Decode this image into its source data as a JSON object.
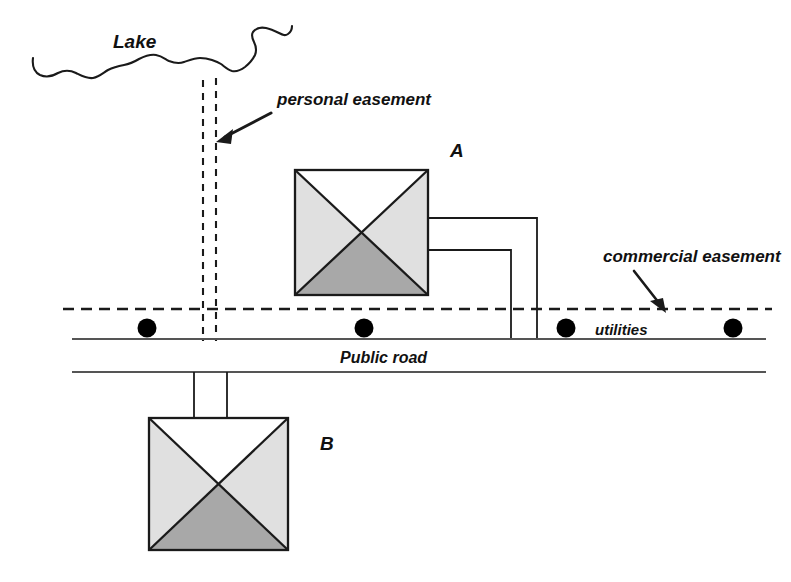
{
  "diagram": {
    "title_labels": {
      "lake": "Lake",
      "personal_easement": "personal easement",
      "commercial_easement": "commercial easement",
      "utilities": "utilities",
      "public_road": "Public road",
      "house_a": "A",
      "house_b": "B"
    },
    "colors": {
      "ink": "#1a1a1a",
      "roof_light": "#e0e0e0",
      "roof_dark": "#a8a8a8",
      "roof_white": "#ffffff",
      "utility_dot": "#000000",
      "background": "#ffffff"
    },
    "features": {
      "lake_shoreline": "wavy-line",
      "personal_easement_style": "dashed-double-vertical",
      "commercial_easement_style": "dashed-horizontal",
      "road_style": "two-parallel-solid-lines",
      "utility_poles_count": 4,
      "house_a_utility_lines": 2,
      "house_b_driveway_lines": 2
    },
    "houses": [
      {
        "id": "A",
        "label": "A",
        "x": 295,
        "y": 170,
        "width": 133,
        "height": 125
      },
      {
        "id": "B",
        "label": "B",
        "x": 149,
        "y": 418,
        "width": 139,
        "height": 132
      }
    ],
    "utility_dots": [
      {
        "cx": 147,
        "cy": 328
      },
      {
        "cx": 364,
        "cy": 328
      },
      {
        "cx": 566,
        "cy": 328
      },
      {
        "cx": 733,
        "cy": 328
      }
    ]
  }
}
